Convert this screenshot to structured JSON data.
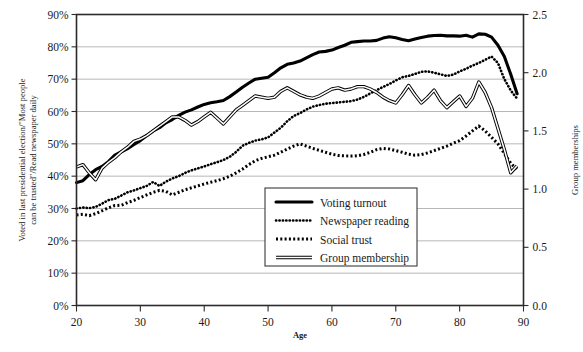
{
  "chart_data": {
    "type": "line",
    "title": "",
    "xlabel": "Age",
    "ylabel": "Voted in last presidential election/\"Most people can be trusted\"/Read newspaper daily",
    "ylabel_right": "Group memberships",
    "xlim": [
      20,
      90
    ],
    "ylim": [
      0,
      90
    ],
    "ylim_right": [
      0.0,
      2.5
    ],
    "grid": true,
    "legend_position": "center",
    "xticks": [
      20,
      30,
      40,
      50,
      60,
      70,
      80,
      90
    ],
    "xticklabels": [
      "20",
      "30",
      "40",
      "50",
      "60",
      "70",
      "80",
      "90"
    ],
    "yticks": [
      0,
      10,
      20,
      30,
      40,
      50,
      60,
      70,
      80,
      90
    ],
    "yticklabels": [
      "0%",
      "10%",
      "20%",
      "30%",
      "40%",
      "50%",
      "60%",
      "70%",
      "80%",
      "90%"
    ],
    "yticks_right": [
      0.0,
      0.5,
      1.0,
      1.5,
      2.0,
      2.5
    ],
    "yticklabels_right": [
      "0.0",
      "0.5",
      "1.0",
      "1.5",
      "2.0",
      "2.5"
    ],
    "x": [
      20,
      21,
      22,
      23,
      24,
      25,
      26,
      27,
      28,
      29,
      30,
      31,
      32,
      33,
      34,
      35,
      36,
      37,
      38,
      39,
      40,
      41,
      42,
      43,
      44,
      45,
      46,
      47,
      48,
      49,
      50,
      51,
      52,
      53,
      54,
      55,
      56,
      57,
      58,
      59,
      60,
      61,
      62,
      63,
      64,
      65,
      66,
      67,
      68,
      69,
      70,
      71,
      72,
      73,
      74,
      75,
      76,
      77,
      78,
      79,
      80,
      81,
      82,
      83,
      84,
      85,
      86,
      87,
      88,
      89
    ],
    "series": [
      {
        "name": "Voting turnout",
        "axis": "left",
        "style": "thick-solid",
        "values": [
          38.0,
          38.6,
          40.5,
          42.0,
          43.0,
          44.5,
          46.5,
          47.5,
          48.5,
          49.8,
          51.0,
          52.6,
          54.0,
          55.0,
          56.5,
          57.5,
          58.8,
          59.8,
          60.5,
          61.4,
          62.2,
          62.7,
          63.0,
          63.4,
          64.6,
          66.0,
          67.5,
          68.8,
          70.0,
          70.3,
          70.6,
          72.0,
          73.5,
          74.6,
          75.0,
          75.6,
          76.6,
          77.6,
          78.4,
          78.6,
          79.0,
          79.8,
          80.5,
          81.4,
          81.6,
          81.8,
          81.8,
          82.0,
          82.7,
          83.1,
          82.8,
          82.3,
          81.9,
          82.4,
          82.9,
          83.3,
          83.5,
          83.6,
          83.4,
          83.4,
          83.3,
          83.6,
          83.0,
          84.0,
          83.9,
          83.0,
          80.5,
          77.0,
          71.5,
          65.5
        ]
      },
      {
        "name": "Newspaper reading",
        "axis": "left",
        "style": "fine-dotted",
        "values": [
          30.0,
          30.3,
          30.1,
          30.5,
          31.5,
          32.6,
          33.0,
          34.0,
          35.0,
          35.6,
          36.3,
          37.0,
          38.2,
          37.0,
          38.3,
          39.3,
          40.0,
          41.0,
          41.8,
          42.4,
          43.0,
          43.7,
          44.3,
          45.0,
          46.0,
          47.5,
          49.4,
          50.3,
          51.0,
          51.4,
          52.0,
          53.5,
          55.0,
          57.0,
          58.6,
          59.5,
          60.6,
          61.5,
          62.0,
          62.4,
          62.6,
          62.8,
          63.0,
          63.2,
          63.7,
          64.5,
          65.6,
          66.6,
          67.6,
          68.5,
          69.6,
          70.6,
          71.0,
          71.6,
          72.3,
          72.4,
          72.0,
          71.5,
          71.0,
          71.4,
          72.4,
          73.2,
          74.2,
          75.0,
          76.0,
          77.0,
          75.0,
          70.0,
          66.5,
          64.0
        ]
      },
      {
        "name": "Social trust",
        "axis": "left",
        "style": "thick-dotted",
        "values": [
          28.0,
          28.2,
          27.8,
          28.4,
          29.3,
          30.2,
          30.9,
          31.0,
          31.8,
          32.5,
          33.4,
          34.2,
          35.0,
          35.6,
          35.3,
          34.2,
          35.0,
          35.8,
          36.4,
          37.0,
          37.6,
          38.1,
          38.6,
          39.2,
          40.0,
          41.0,
          42.2,
          43.6,
          44.8,
          45.5,
          46.0,
          46.5,
          47.4,
          48.4,
          49.3,
          50.0,
          49.3,
          48.6,
          48.0,
          47.4,
          46.8,
          46.4,
          46.3,
          46.2,
          46.3,
          46.7,
          47.4,
          48.2,
          48.6,
          48.4,
          47.9,
          47.4,
          46.8,
          46.5,
          46.7,
          47.2,
          47.9,
          48.6,
          49.3,
          50.2,
          51.0,
          52.4,
          54.0,
          55.5,
          54.0,
          52.0,
          50.0,
          47.0,
          44.0,
          42.0
        ]
      },
      {
        "name": "Group membership",
        "axis": "right",
        "style": "double-line",
        "values": [
          1.19,
          1.21,
          1.14,
          1.08,
          1.18,
          1.23,
          1.27,
          1.32,
          1.36,
          1.41,
          1.43,
          1.46,
          1.5,
          1.54,
          1.58,
          1.62,
          1.62,
          1.59,
          1.55,
          1.58,
          1.62,
          1.66,
          1.61,
          1.56,
          1.62,
          1.68,
          1.72,
          1.76,
          1.8,
          1.79,
          1.78,
          1.79,
          1.84,
          1.87,
          1.84,
          1.81,
          1.79,
          1.78,
          1.8,
          1.83,
          1.86,
          1.87,
          1.85,
          1.86,
          1.88,
          1.88,
          1.86,
          1.83,
          1.79,
          1.76,
          1.74,
          1.81,
          1.89,
          1.81,
          1.74,
          1.79,
          1.85,
          1.76,
          1.7,
          1.75,
          1.8,
          1.71,
          1.78,
          1.92,
          1.83,
          1.7,
          1.52,
          1.34,
          1.14,
          1.2
        ]
      }
    ],
    "legend_entries": [
      {
        "label": "Voting turnout",
        "style": "thick-solid"
      },
      {
        "label": "Newspaper reading",
        "style": "fine-dotted"
      },
      {
        "label": "Social trust",
        "style": "thick-dotted"
      },
      {
        "label": "Group membership",
        "style": "double-line"
      }
    ]
  },
  "colors": {
    "ink": "#000000",
    "grid": "#9a9a9a",
    "frame": "#2b2b2b",
    "background": "#ffffff"
  }
}
